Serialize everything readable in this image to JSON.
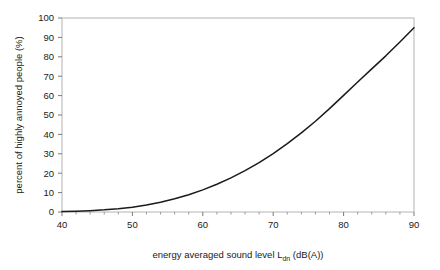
{
  "chart_data": {
    "type": "line",
    "title": "",
    "xlabel": "energy averaged sound level Ldn (dB(A))",
    "xlabel_main": "energy averaged sound level L",
    "xlabel_sub": "dn",
    "xlabel_tail": " (dB(A))",
    "ylabel": "percent of highly annoyed people (%)",
    "xlim": [
      40,
      90
    ],
    "ylim": [
      0,
      100
    ],
    "xticks": [
      40,
      50,
      60,
      70,
      80,
      90
    ],
    "xtick_labels": [
      "40",
      "50",
      "60",
      "70",
      "80",
      "90"
    ],
    "xminor_step": 2,
    "yticks": [
      0,
      10,
      20,
      30,
      40,
      50,
      60,
      70,
      80,
      90,
      100
    ],
    "ytick_labels": [
      "0",
      "10",
      "20",
      "30",
      "40",
      "50",
      "60",
      "70",
      "80",
      "90",
      "100"
    ],
    "grid": false,
    "legend": null,
    "line_color": "#1a1a1a",
    "border_color": "#b4b4b4",
    "background": "#ffffff",
    "series": [
      {
        "name": "percent highly annoyed",
        "x": [
          40,
          42,
          44,
          46,
          48,
          50,
          52,
          54,
          56,
          58,
          60,
          62,
          64,
          66,
          68,
          70,
          72,
          74,
          76,
          78,
          80,
          82,
          84,
          86,
          88,
          90
        ],
        "values": [
          0.2,
          0.4,
          0.7,
          1.1,
          1.7,
          2.5,
          3.6,
          5.0,
          6.8,
          8.9,
          11.4,
          14.3,
          17.6,
          21.3,
          25.5,
          30.1,
          35.2,
          40.8,
          46.8,
          53.3,
          60.1,
          67.0,
          73.8,
          80.5,
          87.6,
          95.0
        ]
      }
    ]
  }
}
